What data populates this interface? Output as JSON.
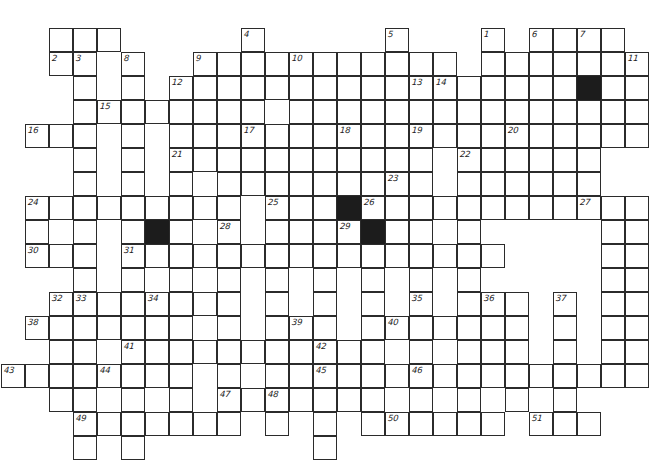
{
  "puzzle": {
    "title": "Crossword Grid",
    "type": "crossword",
    "cell_size": 24,
    "origin_x": 1,
    "origin_y": 4,
    "columns": 27,
    "rows": 18,
    "grid_color": "#2b2b2b",
    "block_color": "#1c1c1c",
    "background_color": "#ffffff",
    "white_cells": [
      [
        2,
        1
      ],
      [
        3,
        1
      ],
      [
        4,
        1
      ],
      [
        3,
        2
      ],
      [
        5,
        2
      ],
      [
        8,
        2
      ],
      [
        9,
        2
      ],
      [
        10,
        2
      ],
      [
        11,
        2
      ],
      [
        12,
        2
      ],
      [
        13,
        2
      ],
      [
        14,
        2
      ],
      [
        15,
        2
      ],
      [
        16,
        2
      ],
      [
        17,
        2
      ],
      [
        18,
        2
      ],
      [
        20,
        2
      ],
      [
        21,
        2
      ],
      [
        22,
        2
      ],
      [
        23,
        2
      ],
      [
        24,
        2
      ],
      [
        25,
        2
      ],
      [
        3,
        3
      ],
      [
        5,
        3
      ],
      [
        7,
        3
      ],
      [
        8,
        3
      ],
      [
        9,
        3
      ],
      [
        10,
        3
      ],
      [
        11,
        3
      ],
      [
        12,
        3
      ],
      [
        13,
        3
      ],
      [
        14,
        3
      ],
      [
        15,
        3
      ],
      [
        16,
        3
      ],
      [
        17,
        3
      ],
      [
        18,
        3
      ],
      [
        20,
        3
      ],
      [
        21,
        3
      ],
      [
        22,
        3
      ],
      [
        23,
        3
      ],
      [
        24,
        3
      ],
      [
        25,
        3
      ],
      [
        3,
        4
      ],
      [
        5,
        4
      ],
      [
        7,
        4
      ],
      [
        8,
        4
      ],
      [
        9,
        4
      ],
      [
        12,
        4
      ],
      [
        13,
        4
      ],
      [
        14,
        4
      ],
      [
        15,
        4
      ],
      [
        16,
        4
      ],
      [
        17,
        4
      ],
      [
        18,
        4
      ],
      [
        19,
        4
      ],
      [
        20,
        4
      ],
      [
        21,
        4
      ],
      [
        22,
        4
      ],
      [
        23,
        4
      ],
      [
        24,
        4
      ],
      [
        25,
        4
      ],
      [
        1,
        5
      ],
      [
        2,
        5
      ],
      [
        3,
        5
      ],
      [
        5,
        5
      ],
      [
        7,
        5
      ],
      [
        8,
        5
      ],
      [
        9,
        5
      ],
      [
        10,
        5
      ],
      [
        11,
        5
      ],
      [
        12,
        5
      ],
      [
        13,
        5
      ],
      [
        14,
        5
      ],
      [
        15,
        5
      ],
      [
        16,
        5
      ],
      [
        17,
        5
      ],
      [
        18,
        5
      ],
      [
        19,
        5
      ],
      [
        20,
        5
      ],
      [
        21,
        5
      ],
      [
        22,
        5
      ],
      [
        23,
        5
      ],
      [
        24,
        5
      ],
      [
        25,
        5
      ],
      [
        3,
        6
      ],
      [
        5,
        6
      ],
      [
        7,
        6
      ],
      [
        8,
        6
      ],
      [
        9,
        6
      ],
      [
        10,
        6
      ],
      [
        11,
        6
      ],
      [
        12,
        6
      ],
      [
        13,
        6
      ],
      [
        14,
        6
      ],
      [
        15,
        6
      ],
      [
        16,
        6
      ],
      [
        17,
        6
      ],
      [
        19,
        6
      ],
      [
        20,
        6
      ],
      [
        21,
        6
      ],
      [
        22,
        6
      ],
      [
        23,
        6
      ],
      [
        24,
        6
      ],
      [
        3,
        7
      ],
      [
        5,
        7
      ],
      [
        7,
        7
      ],
      [
        9,
        7
      ],
      [
        11,
        7
      ],
      [
        13,
        7
      ],
      [
        15,
        7
      ],
      [
        16,
        7
      ],
      [
        17,
        7
      ],
      [
        19,
        7
      ],
      [
        20,
        7
      ],
      [
        21,
        7
      ],
      [
        22,
        7
      ],
      [
        23,
        7
      ],
      [
        24,
        7
      ],
      [
        1,
        8
      ],
      [
        2,
        8
      ],
      [
        3,
        8
      ],
      [
        4,
        8
      ],
      [
        5,
        8
      ],
      [
        6,
        8
      ],
      [
        7,
        8
      ],
      [
        9,
        8
      ],
      [
        11,
        8
      ],
      [
        12,
        8
      ],
      [
        13,
        8
      ],
      [
        14,
        8
      ],
      [
        15,
        8
      ],
      [
        16,
        8
      ],
      [
        17,
        8
      ],
      [
        18,
        8
      ],
      [
        19,
        8
      ],
      [
        20,
        8
      ],
      [
        21,
        8
      ],
      [
        22,
        8
      ],
      [
        23,
        8
      ],
      [
        24,
        8
      ],
      [
        25,
        8
      ],
      [
        26,
        8
      ],
      [
        1,
        9
      ],
      [
        3,
        9
      ],
      [
        5,
        9
      ],
      [
        6,
        9
      ],
      [
        7,
        9
      ],
      [
        9,
        9
      ],
      [
        11,
        9
      ],
      [
        12,
        9
      ],
      [
        13,
        9
      ],
      [
        14,
        9
      ],
      [
        15,
        9
      ],
      [
        16,
        9
      ],
      [
        17,
        9
      ],
      [
        25,
        9
      ],
      [
        26,
        9
      ],
      [
        1,
        10
      ],
      [
        2,
        10
      ],
      [
        3,
        10
      ],
      [
        5,
        10
      ],
      [
        6,
        10
      ],
      [
        7,
        10
      ],
      [
        9,
        10
      ],
      [
        11,
        10
      ],
      [
        12,
        10
      ],
      [
        13,
        10
      ],
      [
        14,
        10
      ],
      [
        15,
        10
      ],
      [
        16,
        10
      ],
      [
        17,
        10
      ],
      [
        18,
        10
      ],
      [
        19,
        10
      ],
      [
        20,
        10
      ],
      [
        25,
        10
      ],
      [
        26,
        10
      ],
      [
        3,
        11
      ],
      [
        5,
        11
      ],
      [
        7,
        11
      ],
      [
        9,
        11
      ],
      [
        11,
        11
      ],
      [
        13,
        11
      ],
      [
        15,
        11
      ],
      [
        17,
        11
      ],
      [
        19,
        11
      ],
      [
        25,
        11
      ],
      [
        26,
        11
      ],
      [
        3,
        12
      ],
      [
        4,
        12
      ],
      [
        5,
        12
      ],
      [
        6,
        12
      ],
      [
        7,
        12
      ],
      [
        8,
        12
      ],
      [
        9,
        12
      ],
      [
        11,
        12
      ],
      [
        13,
        12
      ],
      [
        15,
        12
      ],
      [
        17,
        12
      ],
      [
        19,
        12
      ],
      [
        21,
        12
      ],
      [
        23,
        12
      ],
      [
        25,
        12
      ],
      [
        26,
        12
      ],
      [
        2,
        13
      ],
      [
        3,
        13
      ],
      [
        5,
        13
      ],
      [
        7,
        13
      ],
      [
        9,
        13
      ],
      [
        11,
        13
      ],
      [
        13,
        13
      ],
      [
        15,
        13
      ],
      [
        17,
        13
      ],
      [
        19,
        13
      ],
      [
        21,
        13
      ],
      [
        23,
        13
      ],
      [
        25,
        13
      ],
      [
        26,
        13
      ],
      [
        2,
        14
      ],
      [
        3,
        14
      ],
      [
        5,
        14
      ],
      [
        6,
        14
      ],
      [
        7,
        14
      ],
      [
        8,
        14
      ],
      [
        9,
        14
      ],
      [
        10,
        14
      ],
      [
        11,
        14
      ],
      [
        12,
        14
      ],
      [
        13,
        14
      ],
      [
        15,
        14
      ],
      [
        17,
        14
      ],
      [
        19,
        14
      ],
      [
        21,
        14
      ],
      [
        23,
        14
      ],
      [
        25,
        14
      ],
      [
        26,
        14
      ],
      [
        1,
        15
      ],
      [
        2,
        15
      ],
      [
        3,
        15
      ],
      [
        4,
        15
      ],
      [
        5,
        15
      ],
      [
        6,
        15
      ],
      [
        7,
        15
      ],
      [
        9,
        15
      ],
      [
        11,
        15
      ],
      [
        13,
        15
      ],
      [
        15,
        15
      ],
      [
        17,
        15
      ],
      [
        19,
        15
      ],
      [
        21,
        15
      ],
      [
        23,
        15
      ],
      [
        25,
        15
      ],
      [
        26,
        15
      ],
      [
        2,
        15
      ],
      [
        3,
        16
      ],
      [
        5,
        16
      ],
      [
        7,
        16
      ],
      [
        9,
        16
      ],
      [
        11,
        16
      ],
      [
        13,
        16
      ],
      [
        15,
        16
      ],
      [
        17,
        16
      ],
      [
        19,
        16
      ],
      [
        21,
        16
      ],
      [
        23,
        16
      ],
      [
        3,
        17
      ],
      [
        5,
        17
      ],
      [
        7,
        17
      ],
      [
        9,
        17
      ],
      [
        11,
        17
      ],
      [
        13,
        17
      ],
      [
        15,
        17
      ],
      [
        17,
        17
      ]
    ],
    "block_cells": [
      [
        24,
        3
      ],
      [
        6,
        9
      ],
      [
        14,
        8
      ],
      [
        15,
        9
      ]
    ],
    "clue_numbers": [
      {
        "n": "1",
        "col": 20,
        "row": 1
      },
      {
        "n": "2",
        "col": 2,
        "row": 2
      },
      {
        "n": "3",
        "col": 3,
        "row": 2
      },
      {
        "n": "4",
        "col": 10,
        "row": 1
      },
      {
        "n": "5",
        "col": 16,
        "row": 1
      },
      {
        "n": "6",
        "col": 22,
        "row": 1
      },
      {
        "n": "7",
        "col": 24,
        "row": 1
      },
      {
        "n": "8",
        "col": 5,
        "row": 2
      },
      {
        "n": "9",
        "col": 8,
        "row": 2
      },
      {
        "n": "10",
        "col": 12,
        "row": 2
      },
      {
        "n": "11",
        "col": 26,
        "row": 2
      },
      {
        "n": "12",
        "col": 7,
        "row": 3
      },
      {
        "n": "13",
        "col": 17,
        "row": 3
      },
      {
        "n": "14",
        "col": 18,
        "row": 3
      },
      {
        "n": "15",
        "col": 4,
        "row": 4
      },
      {
        "n": "16",
        "col": 1,
        "row": 5
      },
      {
        "n": "17",
        "col": 10,
        "row": 5
      },
      {
        "n": "18",
        "col": 14,
        "row": 5
      },
      {
        "n": "19",
        "col": 17,
        "row": 5
      },
      {
        "n": "20",
        "col": 21,
        "row": 5
      },
      {
        "n": "21",
        "col": 7,
        "row": 6
      },
      {
        "n": "22",
        "col": 19,
        "row": 6
      },
      {
        "n": "23",
        "col": 16,
        "row": 7
      },
      {
        "n": "24",
        "col": 1,
        "row": 8
      },
      {
        "n": "25",
        "col": 11,
        "row": 8
      },
      {
        "n": "26",
        "col": 15,
        "row": 8
      },
      {
        "n": "27",
        "col": 24,
        "row": 8
      },
      {
        "n": "28",
        "col": 9,
        "row": 9
      },
      {
        "n": "29",
        "col": 14,
        "row": 9
      },
      {
        "n": "30",
        "col": 1,
        "row": 10
      },
      {
        "n": "31",
        "col": 5,
        "row": 10
      },
      {
        "n": "32",
        "col": 2,
        "row": 12
      },
      {
        "n": "33",
        "col": 3,
        "row": 12
      },
      {
        "n": "34",
        "col": 6,
        "row": 12
      },
      {
        "n": "35",
        "col": 17,
        "row": 12
      },
      {
        "n": "36",
        "col": 20,
        "row": 12
      },
      {
        "n": "37",
        "col": 23,
        "row": 12
      },
      {
        "n": "38",
        "col": 1,
        "row": 13
      },
      {
        "n": "39",
        "col": 12,
        "row": 13
      },
      {
        "n": "40",
        "col": 16,
        "row": 13
      },
      {
        "n": "41",
        "col": 5,
        "row": 14
      },
      {
        "n": "42",
        "col": 13,
        "row": 14
      },
      {
        "n": "43",
        "col": 0,
        "row": 15
      },
      {
        "n": "44",
        "col": 4,
        "row": 15
      },
      {
        "n": "45",
        "col": 13,
        "row": 15
      },
      {
        "n": "46",
        "col": 17,
        "row": 15
      },
      {
        "n": "47",
        "col": 9,
        "row": 16
      },
      {
        "n": "48",
        "col": 11,
        "row": 16
      },
      {
        "n": "49",
        "col": 3,
        "row": 17
      },
      {
        "n": "50",
        "col": 16,
        "row": 17
      },
      {
        "n": "51",
        "col": 22,
        "row": 17
      }
    ]
  }
}
